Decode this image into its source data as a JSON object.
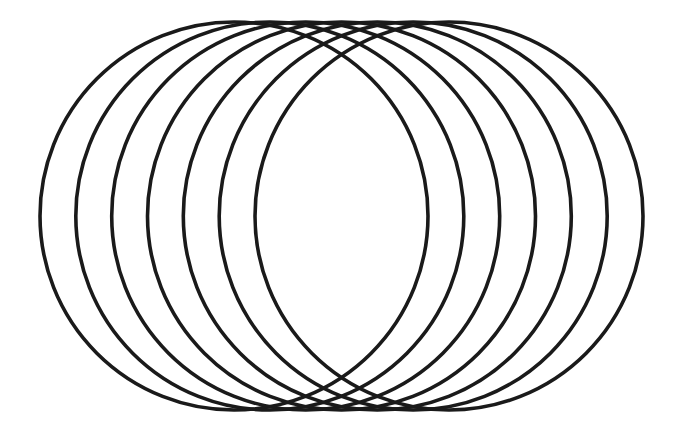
{
  "figure": {
    "background_color": "#ffffff",
    "stroke_color": "#1a1a1a",
    "stroke_width": 3.6,
    "canvas": {
      "width": 686,
      "height": 433
    }
  },
  "chart_data": {
    "type": "scatter",
    "subtitle": "",
    "xlabel": "",
    "ylabel": "",
    "xlim": [
      0,
      686
    ],
    "ylim": [
      0,
      433
    ],
    "grid": false,
    "legend": null,
    "annotations": [],
    "shape": "circle",
    "count": 7,
    "radius": 194,
    "center_y": 216,
    "center_x_start": 234,
    "center_x_end": 449,
    "center_spacing": 35.8,
    "bounds": {
      "left": 40,
      "right": 643,
      "top": 22,
      "bottom": 410
    },
    "circles": [
      {
        "index": 1,
        "cx": 234,
        "cy": 216,
        "r": 194
      },
      {
        "index": 2,
        "cx": 269.8,
        "cy": 216,
        "r": 194
      },
      {
        "index": 3,
        "cx": 305.7,
        "cy": 216,
        "r": 194
      },
      {
        "index": 4,
        "cx": 341.5,
        "cy": 216,
        "r": 194
      },
      {
        "index": 5,
        "cx": 377.3,
        "cy": 216,
        "r": 194
      },
      {
        "index": 6,
        "cx": 413.2,
        "cy": 216,
        "r": 194
      },
      {
        "index": 7,
        "cx": 449,
        "cy": 216,
        "r": 194
      }
    ]
  }
}
